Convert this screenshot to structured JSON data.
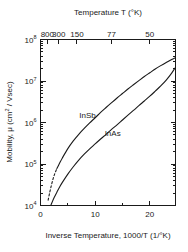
{
  "chart_data": {
    "type": "line",
    "title": "",
    "xlabel": "Inverse Temperature, 1000/T (1/°K)",
    "ylabel": "Mobility, μ (cm² / Vsec)",
    "xlim": [
      0,
      24.7
    ],
    "ylim": [
      10000,
      100000000
    ],
    "yscale": "log",
    "grid": false,
    "legend_position": "inline-annotation",
    "secondary_xaxis": {
      "label": "Temperature  T (°K)",
      "tick_labels": [
        "800",
        "300",
        "150",
        "77",
        "50",
        "40"
      ],
      "tick_values_inverse_temp": [
        1.25,
        3.33,
        6.67,
        13.0,
        20.0,
        25.0
      ]
    },
    "xticks": [
      0,
      10,
      20
    ],
    "xtick_labels": [
      "0",
      "10",
      "20"
    ],
    "xminor_step": 5,
    "yticks": [
      10000,
      100000,
      1000000,
      10000000,
      100000000
    ],
    "ytick_labels": [
      "10⁴",
      "10⁵",
      "10⁶",
      "10⁷",
      "10⁸"
    ],
    "ytick_bases": [
      "10",
      "10",
      "10",
      "10",
      "10"
    ],
    "ytick_exponents": [
      "4",
      "5",
      "6",
      "7",
      "8"
    ],
    "series": [
      {
        "name": "InSb",
        "label": "InSb",
        "color": "#1a1a1a",
        "style": "solid-with-dashed-lowend",
        "annotation_x": 8.6,
        "annotation_y": 1250000,
        "points": [
          [
            1.4,
            13500
          ],
          [
            1.7,
            21000
          ],
          [
            2.0,
            31000
          ],
          [
            2.3,
            44000
          ],
          [
            2.6,
            58000
          ],
          [
            3.0,
            78000
          ],
          [
            3.5,
            105000
          ],
          [
            4.0,
            140000
          ],
          [
            5.0,
            235000
          ],
          [
            6.0,
            360000
          ],
          [
            7.0,
            520000
          ],
          [
            8.0,
            720000
          ],
          [
            9.0,
            980000
          ],
          [
            10.0,
            1300000
          ],
          [
            11.0,
            1750000
          ],
          [
            12.0,
            2300000
          ],
          [
            13.0,
            3000000
          ],
          [
            14.0,
            3900000
          ],
          [
            15.0,
            5000000
          ],
          [
            16.0,
            6400000
          ],
          [
            17.0,
            8100000
          ],
          [
            18.0,
            10200000
          ],
          [
            19.0,
            12800000
          ],
          [
            20.0,
            15800000
          ],
          [
            21.0,
            19500000
          ],
          [
            22.0,
            23500000
          ],
          [
            23.0,
            28000000
          ],
          [
            24.0,
            33000000
          ],
          [
            24.6,
            36000000
          ]
        ],
        "dashed_points": [
          [
            1.4,
            13500
          ],
          [
            1.7,
            21000
          ],
          [
            2.0,
            31000
          ],
          [
            2.3,
            44000
          ],
          [
            2.6,
            58000
          ],
          [
            3.0,
            78000
          ]
        ]
      },
      {
        "name": "InAs",
        "label": "InAs",
        "color": "#1a1a1a",
        "style": "solid",
        "annotation_x": 13.2,
        "annotation_y": 460000,
        "points": [
          [
            1.9,
            10200
          ],
          [
            2.5,
            15500
          ],
          [
            3.0,
            21000
          ],
          [
            3.5,
            28000
          ],
          [
            4.0,
            36000
          ],
          [
            5.0,
            57000
          ],
          [
            6.0,
            86000
          ],
          [
            7.0,
            124000
          ],
          [
            8.0,
            172000
          ],
          [
            9.0,
            232000
          ],
          [
            10.0,
            305000
          ],
          [
            11.0,
            400000
          ],
          [
            12.0,
            520000
          ],
          [
            13.0,
            680000
          ],
          [
            14.0,
            880000
          ],
          [
            15.0,
            1150000
          ],
          [
            16.0,
            1500000
          ],
          [
            17.0,
            1950000
          ],
          [
            18.0,
            2550000
          ],
          [
            19.0,
            3300000
          ],
          [
            20.0,
            4300000
          ],
          [
            21.0,
            5700000
          ],
          [
            22.0,
            7600000
          ],
          [
            23.0,
            10500000
          ],
          [
            24.0,
            15500000
          ],
          [
            24.6,
            20500000
          ]
        ]
      }
    ]
  }
}
